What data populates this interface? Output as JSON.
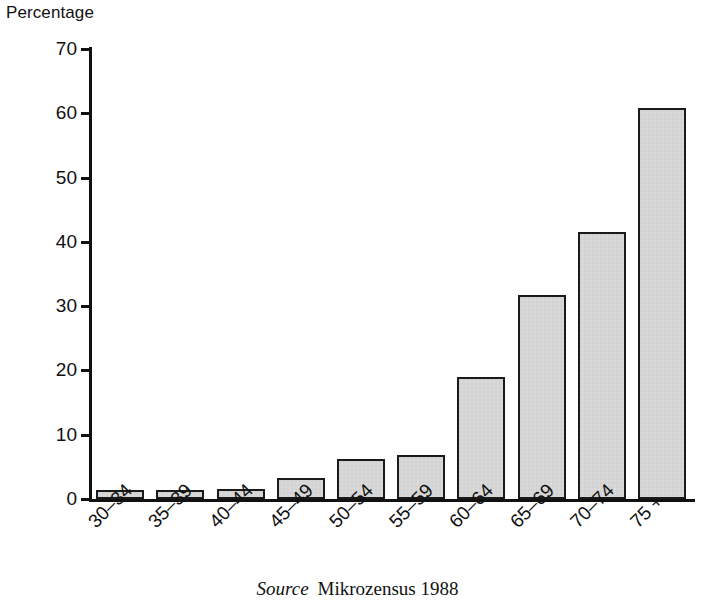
{
  "axis_title": "Percentage",
  "source": {
    "label": "Source",
    "text": "Mikrozensus 1988"
  },
  "chart_data": {
    "type": "bar",
    "title": "",
    "xlabel": "",
    "ylabel": "Percentage",
    "ylim": [
      0,
      70
    ],
    "ytick_values": [
      0,
      10,
      20,
      30,
      40,
      50,
      60,
      70
    ],
    "ytick_labels": [
      "0",
      "10",
      "20",
      "30",
      "40",
      "50",
      "60",
      "70"
    ],
    "grid": false,
    "legend": "none",
    "categories": [
      "30–34",
      "35–39",
      "40–44",
      "45–49",
      "50–54",
      "55–59",
      "60–64",
      "65–69",
      "70–74",
      "75 +"
    ],
    "values": [
      1.4,
      1.4,
      1.5,
      3.3,
      6.2,
      6.9,
      19.0,
      31.8,
      41.5,
      60.8
    ],
    "bar_fill_color": "#d2d2d2",
    "bar_edge_color": "#1a1a1a",
    "bar_pattern": "checkerboard-halftone",
    "label_rotation_deg": -45
  }
}
